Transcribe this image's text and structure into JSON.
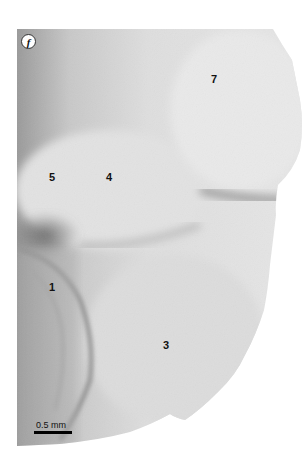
{
  "figure": {
    "panel_label": "f",
    "scale_bar": {
      "label": "0.5 mm"
    },
    "region_labels": [
      {
        "id": "1",
        "text": "1",
        "x": 52,
        "y": 287
      },
      {
        "id": "3",
        "text": "3",
        "x": 166,
        "y": 345
      },
      {
        "id": "4",
        "text": "4",
        "x": 109,
        "y": 177
      },
      {
        "id": "5",
        "text": "5",
        "x": 52,
        "y": 177
      },
      {
        "id": "7",
        "text": "7",
        "x": 214,
        "y": 79
      }
    ],
    "colors": {
      "background": "#ffffff",
      "specimen_light": "#e4e4e4",
      "specimen_mid": "#cfcfcf",
      "specimen_dark": "#7a7a7a",
      "text": "#111111"
    }
  }
}
